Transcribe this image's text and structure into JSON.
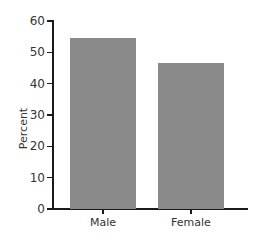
{
  "chart_data": {
    "type": "bar",
    "title": "",
    "categories": [
      "Male",
      "Female"
    ],
    "values": [
      54.5,
      46.5
    ],
    "xlabel": "",
    "ylabel": "Percent",
    "ylim": [
      0,
      60
    ],
    "yticks": [
      "0",
      "10",
      "20",
      "30",
      "40",
      "50",
      "60"
    ],
    "grid": false,
    "legend": null,
    "bar_color": "#8a8a8a"
  }
}
